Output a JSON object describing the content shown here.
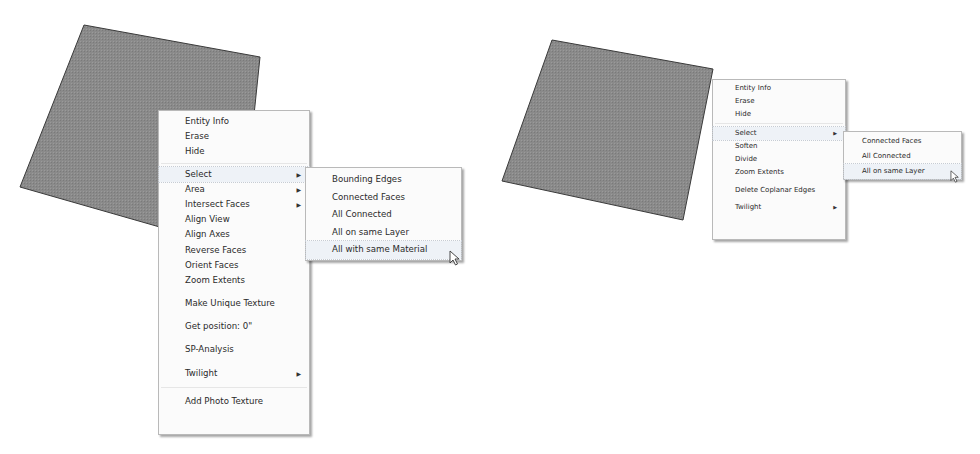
{
  "colors": {
    "face_fill": "#8a8a8a",
    "face_edge": "#3a3a3a",
    "menu_bg": "#fbfbfb",
    "menu_border": "#b9b9b9",
    "highlight": "#eef2f7"
  },
  "left_example": {
    "context_menu": {
      "items": [
        {
          "label": "Entity Info"
        },
        {
          "label": "Erase"
        },
        {
          "label": "Hide"
        },
        {
          "label": "Select",
          "submenu": true,
          "highlighted": true
        },
        {
          "label": "Area",
          "submenu": true
        },
        {
          "label": "Intersect Faces",
          "submenu": true
        },
        {
          "label": "Align View"
        },
        {
          "label": "Align Axes"
        },
        {
          "label": "Reverse Faces"
        },
        {
          "label": "Orient Faces"
        },
        {
          "label": "Zoom Extents"
        },
        {
          "label": "Make Unique Texture"
        },
        {
          "label": "Get position: 0\""
        },
        {
          "label": "SP-Analysis"
        },
        {
          "label": "Twilight",
          "submenu": true
        },
        {
          "label": "Add Photo Texture"
        }
      ]
    },
    "select_submenu": {
      "items": [
        {
          "label": "Bounding Edges"
        },
        {
          "label": "Connected Faces"
        },
        {
          "label": "All Connected"
        },
        {
          "label": "All on same Layer"
        },
        {
          "label": "All with same Material",
          "highlighted": true
        }
      ]
    }
  },
  "right_example": {
    "context_menu": {
      "items": [
        {
          "label": "Entity Info"
        },
        {
          "label": "Erase"
        },
        {
          "label": "Hide"
        },
        {
          "label": "Select",
          "submenu": true,
          "highlighted": true
        },
        {
          "label": "Soften"
        },
        {
          "label": "Divide"
        },
        {
          "label": "Zoom Extents"
        },
        {
          "label": "Delete Coplanar Edges"
        },
        {
          "label": "Twilight",
          "submenu": true
        }
      ]
    },
    "select_submenu": {
      "items": [
        {
          "label": "Connected Faces"
        },
        {
          "label": "All Connected"
        },
        {
          "label": "All on same Layer",
          "highlighted": true
        }
      ]
    }
  },
  "icons": {
    "submenu_arrow": "▶",
    "cursor": "arrow-pointer"
  }
}
